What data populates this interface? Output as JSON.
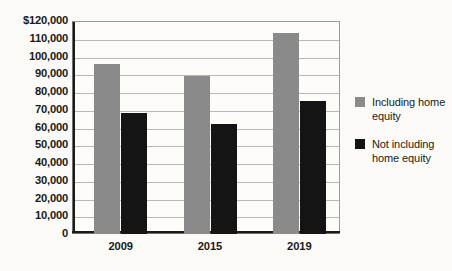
{
  "chart_data": {
    "type": "bar",
    "title": "",
    "subtitle": "",
    "xlabel": "",
    "ylabel": "",
    "categories": [
      "2009",
      "2015",
      "2019"
    ],
    "series": [
      {
        "name": "Including home equity",
        "color": "#8a8a8a",
        "values": [
          96000,
          89000,
          113000
        ]
      },
      {
        "name": "Not including home equity",
        "color": "#141414",
        "values": [
          68000,
          62000,
          75000
        ]
      }
    ],
    "ylim": [
      0,
      120000
    ],
    "ytick_step": 10000,
    "ytick_labels": [
      "$120,000",
      "110,000",
      "100,000",
      "90,000",
      "80,000",
      "70,000",
      "60,000",
      "50,000",
      "40,000",
      "30,000",
      "20,000",
      "10,000",
      "0"
    ],
    "ytick_values": [
      120000,
      110000,
      100000,
      90000,
      80000,
      70000,
      60000,
      50000,
      40000,
      30000,
      20000,
      10000,
      0
    ],
    "grid": true,
    "legend_position": "right",
    "background_color": "#fbfaf7",
    "plot_background_color": "#fdfcf9",
    "gridline_color": "#b8b8b8",
    "axis_color": "#1a1a1a"
  }
}
